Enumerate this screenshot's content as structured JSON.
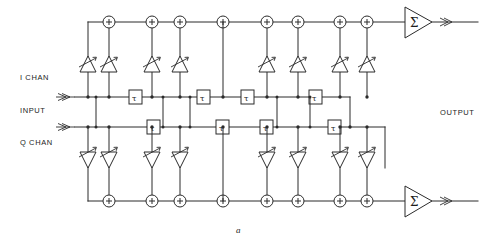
{
  "figure": {
    "caption": "a",
    "labels": {
      "i_chan": "I CHAN",
      "input": "INPUT",
      "q_chan": "Q CHAN",
      "output": "OUTPUT"
    },
    "symbols": {
      "delay_element": "τ",
      "summing_node": "+",
      "output_amplifier": "Σ",
      "variable_gain_tap": "variable-gain-amplifier"
    },
    "colors": {
      "line": "#2b2b2b",
      "background": "#ffffff",
      "text": "#1d1d1d"
    },
    "structure": {
      "i_branch_sum_count": 8,
      "q_branch_sum_count": 8,
      "i_tap_count": 8,
      "q_tap_count": 8,
      "i_delay_count": 4,
      "q_delay_count": 4,
      "output_amplifier_count": 2
    }
  },
  "geometry": {
    "top_sum_y": 22,
    "top_tap_y": 62,
    "i_line_y": 97,
    "q_line_y": 127,
    "bottom_tap_y": 162,
    "bottom_sum_y": 201,
    "sum_x": [
      109,
      152,
      180,
      223,
      267,
      298,
      340,
      367
    ],
    "tap_x": [
      88,
      109,
      152,
      180,
      267,
      298,
      340,
      367
    ],
    "i_delay_x": [
      135,
      203,
      247,
      315
    ],
    "q_delay_x": [
      153,
      222,
      266,
      334
    ],
    "i_bus_left": 75,
    "q_bus_left": 75,
    "bus_right": 395,
    "amp_x": 405,
    "out_x": 478
  }
}
